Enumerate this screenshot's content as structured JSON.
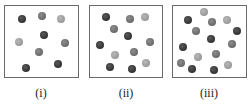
{
  "panels": [
    {
      "label": "(i)",
      "box": {
        "left": 4,
        "top": 5,
        "width": 75,
        "height": 73
      },
      "label_x": 41,
      "balls": [
        {
          "x": 22,
          "y": 19,
          "shade": "dark"
        },
        {
          "x": 42,
          "y": 16,
          "shade": "mid"
        },
        {
          "x": 61,
          "y": 19,
          "shade": "light"
        },
        {
          "x": 19,
          "y": 42,
          "shade": "light"
        },
        {
          "x": 44,
          "y": 35,
          "shade": "dark"
        },
        {
          "x": 65,
          "y": 43,
          "shade": "mid"
        },
        {
          "x": 39,
          "y": 52,
          "shade": "mid"
        },
        {
          "x": 58,
          "y": 64,
          "shade": "dark"
        },
        {
          "x": 26,
          "y": 68,
          "shade": "dark"
        }
      ]
    },
    {
      "label": "(ii)",
      "box": {
        "left": 89,
        "top": 5,
        "width": 74,
        "height": 73
      },
      "label_x": 126,
      "balls": [
        {
          "x": 106,
          "y": 17,
          "shade": "dark"
        },
        {
          "x": 130,
          "y": 19,
          "shade": "mid"
        },
        {
          "x": 145,
          "y": 17,
          "shade": "light"
        },
        {
          "x": 114,
          "y": 29,
          "shade": "mid"
        },
        {
          "x": 128,
          "y": 36,
          "shade": "dark"
        },
        {
          "x": 150,
          "y": 42,
          "shade": "mid"
        },
        {
          "x": 100,
          "y": 45,
          "shade": "dark"
        },
        {
          "x": 115,
          "y": 55,
          "shade": "light"
        },
        {
          "x": 134,
          "y": 52,
          "shade": "mid"
        },
        {
          "x": 110,
          "y": 67,
          "shade": "dark"
        },
        {
          "x": 132,
          "y": 69,
          "shade": "dark"
        },
        {
          "x": 146,
          "y": 63,
          "shade": "light"
        }
      ]
    },
    {
      "label": "(iii)",
      "box": {
        "left": 172,
        "top": 5,
        "width": 75,
        "height": 73
      },
      "label_x": 209,
      "balls": [
        {
          "x": 204,
          "y": 12,
          "shade": "light"
        },
        {
          "x": 188,
          "y": 20,
          "shade": "dark"
        },
        {
          "x": 212,
          "y": 22,
          "shade": "mid"
        },
        {
          "x": 227,
          "y": 20,
          "shade": "light"
        },
        {
          "x": 196,
          "y": 31,
          "shade": "mid"
        },
        {
          "x": 237,
          "y": 31,
          "shade": "dark"
        },
        {
          "x": 211,
          "y": 39,
          "shade": "dark"
        },
        {
          "x": 232,
          "y": 44,
          "shade": "mid"
        },
        {
          "x": 183,
          "y": 47,
          "shade": "dark"
        },
        {
          "x": 198,
          "y": 57,
          "shade": "light"
        },
        {
          "x": 216,
          "y": 54,
          "shade": "mid"
        },
        {
          "x": 181,
          "y": 63,
          "shade": "mid"
        },
        {
          "x": 192,
          "y": 69,
          "shade": "dark"
        },
        {
          "x": 214,
          "y": 70,
          "shade": "dark"
        },
        {
          "x": 228,
          "y": 65,
          "shade": "light"
        }
      ]
    }
  ],
  "colors": {
    "dark": "#333333",
    "mid": "#6a6a6a",
    "light": "#9a9a9a",
    "border": "#6a6a6a"
  }
}
